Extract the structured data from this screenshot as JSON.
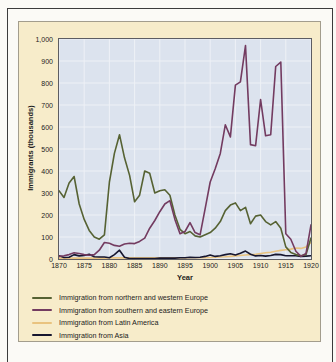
{
  "chart_data": {
    "type": "line",
    "title": "",
    "x_label": "Year",
    "y_label": "Immigrants (thousands)",
    "x_range": [
      1870,
      1920
    ],
    "y_range": [
      0,
      1000
    ],
    "x_tick_labels": [
      "1870",
      "1875",
      "1880",
      "1885",
      "1890",
      "1895",
      "1900",
      "1905",
      "1910",
      "1915",
      "1920"
    ],
    "y_tick_labels": [
      "0",
      "100",
      "200",
      "300",
      "400",
      "500",
      "600",
      "700",
      "800",
      "900",
      "1,000"
    ],
    "grid": true,
    "legend_position": "below-left",
    "years": [
      1870,
      1871,
      1872,
      1873,
      1874,
      1875,
      1876,
      1877,
      1878,
      1879,
      1880,
      1881,
      1882,
      1883,
      1884,
      1885,
      1886,
      1887,
      1888,
      1889,
      1890,
      1891,
      1892,
      1893,
      1894,
      1895,
      1896,
      1897,
      1898,
      1899,
      1900,
      1901,
      1902,
      1903,
      1904,
      1905,
      1906,
      1907,
      1908,
      1909,
      1910,
      1911,
      1912,
      1913,
      1914,
      1915,
      1916,
      1917,
      1918,
      1919,
      1920
    ],
    "series": [
      {
        "name": "Immigration from northern and western Europe",
        "color": "#566233",
        "values": [
          310,
          280,
          345,
          375,
          250,
          180,
          130,
          100,
          90,
          110,
          350,
          480,
          565,
          460,
          380,
          260,
          290,
          400,
          390,
          300,
          310,
          315,
          290,
          200,
          135,
          115,
          125,
          105,
          100,
          110,
          120,
          140,
          170,
          220,
          245,
          255,
          220,
          235,
          160,
          195,
          200,
          170,
          155,
          170,
          140,
          55,
          30,
          20,
          15,
          20,
          95
        ]
      },
      {
        "name": "Immigration from southern and eastern Europe",
        "color": "#733b60",
        "values": [
          12,
          15,
          20,
          28,
          25,
          20,
          17,
          20,
          40,
          75,
          72,
          62,
          58,
          68,
          72,
          70,
          80,
          95,
          140,
          175,
          215,
          250,
          265,
          180,
          115,
          125,
          165,
          120,
          110,
          230,
          350,
          410,
          480,
          610,
          555,
          790,
          805,
          970,
          520,
          515,
          725,
          560,
          565,
          875,
          895,
          115,
          90,
          35,
          12,
          25,
          155
        ]
      },
      {
        "name": "Immigration from Latin America",
        "color": "#e9c37f",
        "values": [
          4,
          4,
          4,
          4,
          4,
          4,
          4,
          4,
          4,
          4,
          5,
          5,
          5,
          5,
          5,
          5,
          5,
          5,
          5,
          5,
          5,
          5,
          5,
          5,
          5,
          5,
          6,
          6,
          6,
          6,
          7,
          8,
          9,
          10,
          12,
          14,
          16,
          18,
          20,
          22,
          25,
          28,
          31,
          35,
          39,
          42,
          45,
          50,
          48,
          55,
          75
        ]
      },
      {
        "name": "Immigration from Asia",
        "color": "#16162f",
        "values": [
          15,
          7,
          8,
          20,
          14,
          16,
          22,
          10,
          9,
          9,
          6,
          20,
          40,
          8,
          2,
          2,
          2,
          2,
          2,
          2,
          4,
          4,
          4,
          4,
          6,
          6,
          8,
          7,
          8,
          12,
          18,
          12,
          15,
          20,
          24,
          18,
          26,
          36,
          22,
          14,
          16,
          13,
          16,
          21,
          20,
          15,
          15,
          15,
          12,
          13,
          15
        ]
      }
    ],
    "colors": {
      "panel_background": "#f7ecca",
      "plot_background": "#dce3ee",
      "gridline": "#eef1f6",
      "axis_text": "#1c1c1c",
      "panel_border": "#a39d8d",
      "frame_line": "#3c3c3c"
    }
  }
}
